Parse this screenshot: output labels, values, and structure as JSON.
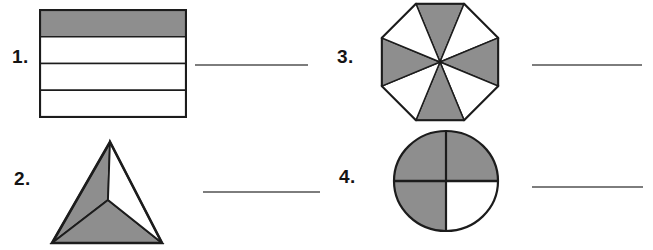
{
  "page": {
    "background": "#ffffff",
    "shade_color": "#8e8e8e",
    "outline_color": "#1c1c1c",
    "blank_line_color": "#7d7d7d"
  },
  "items": [
    {
      "number": "1.",
      "shape": "rectangle-4-horizontal-strips",
      "total_parts": 4,
      "shaded_parts": 1,
      "answer": ""
    },
    {
      "number": "2.",
      "shape": "triangle-3-parts",
      "total_parts": 3,
      "shaded_parts": 2,
      "answer": ""
    },
    {
      "number": "3.",
      "shape": "octagon-8-sectors",
      "total_parts": 8,
      "shaded_parts": 4,
      "answer": ""
    },
    {
      "number": "4.",
      "shape": "circle-4-quarters",
      "total_parts": 4,
      "shaded_parts": 3,
      "answer": ""
    }
  ]
}
